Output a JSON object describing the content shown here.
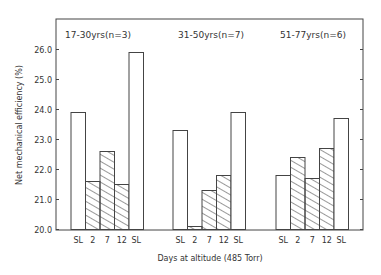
{
  "chart_data": {
    "type": "bar",
    "title": "",
    "xlabel": "Days at altitude (485 Torr)",
    "ylabel": "Net mechanical efficiency (%)",
    "ylim": [
      20.0,
      27.0
    ],
    "yticks": [
      "20.0",
      "21.0",
      "22.0",
      "23.0",
      "24.0",
      "25.0",
      "26.0"
    ],
    "grid": false,
    "categories": [
      "SL",
      "2",
      "7",
      "12",
      "SL"
    ],
    "groups": [
      {
        "name": "17-30yrs(n=3)",
        "values": [
          23.9,
          21.6,
          22.6,
          21.5,
          25.9
        ]
      },
      {
        "name": "31-50yrs(n=7)",
        "values": [
          23.3,
          20.1,
          21.3,
          21.8,
          23.9
        ]
      },
      {
        "name": "51-77yrs(n=6)",
        "values": [
          21.8,
          22.4,
          21.7,
          22.7,
          23.7
        ]
      }
    ],
    "bar_styles": [
      "open",
      "hatched",
      "hatched",
      "hatched",
      "open"
    ]
  },
  "labels": {
    "group1": "17-30yrs(n=3)",
    "group2": "31-50yrs(n=7)",
    "group3": "51-77yrs(n=6)",
    "xlabel": "Days at altitude (485 Torr)",
    "ylabel": "Net mechanical efficiency (%)"
  }
}
